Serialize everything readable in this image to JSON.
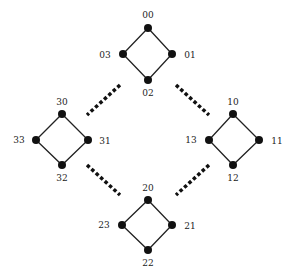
{
  "diagram": {
    "title": "",
    "groups": [
      {
        "name": "0",
        "nodes": [
          {
            "id": "00",
            "x": 148,
            "y": 28,
            "lx": 148,
            "ly": 15
          },
          {
            "id": "01",
            "x": 172,
            "y": 54,
            "lx": 190,
            "ly": 55
          },
          {
            "id": "02",
            "x": 148,
            "y": 80,
            "lx": 148,
            "ly": 93
          },
          {
            "id": "03",
            "x": 123,
            "y": 54,
            "lx": 105,
            "ly": 55
          }
        ]
      },
      {
        "name": "1",
        "nodes": [
          {
            "id": "10",
            "x": 233,
            "y": 114,
            "lx": 233,
            "ly": 102
          },
          {
            "id": "11",
            "x": 259,
            "y": 140,
            "lx": 277,
            "ly": 141
          },
          {
            "id": "12",
            "x": 233,
            "y": 165,
            "lx": 233,
            "ly": 178
          },
          {
            "id": "13",
            "x": 209,
            "y": 140,
            "lx": 191,
            "ly": 140
          }
        ]
      },
      {
        "name": "2",
        "nodes": [
          {
            "id": "20",
            "x": 148,
            "y": 200,
            "lx": 148,
            "ly": 188
          },
          {
            "id": "21",
            "x": 172,
            "y": 225,
            "lx": 190,
            "ly": 226
          },
          {
            "id": "22",
            "x": 148,
            "y": 250,
            "lx": 148,
            "ly": 263
          },
          {
            "id": "23",
            "x": 122,
            "y": 225,
            "lx": 104,
            "ly": 225
          }
        ]
      },
      {
        "name": "3",
        "nodes": [
          {
            "id": "30",
            "x": 62,
            "y": 114,
            "lx": 62,
            "ly": 102
          },
          {
            "id": "31",
            "x": 88,
            "y": 140,
            "lx": 105,
            "ly": 141
          },
          {
            "id": "32",
            "x": 62,
            "y": 165,
            "lx": 62,
            "ly": 178
          },
          {
            "id": "33",
            "x": 36,
            "y": 140,
            "lx": 19,
            "ly": 140
          }
        ]
      }
    ],
    "dotted_links": [
      {
        "from": "0",
        "to": "3",
        "x1": 120,
        "y1": 85,
        "x2": 87,
        "y2": 115
      },
      {
        "from": "0",
        "to": "1",
        "x1": 176,
        "y1": 85,
        "x2": 209,
        "y2": 115
      },
      {
        "from": "3",
        "to": "2",
        "x1": 87,
        "y1": 165,
        "x2": 120,
        "y2": 195
      },
      {
        "from": "1",
        "to": "2",
        "x1": 209,
        "y1": 165,
        "x2": 176,
        "y2": 195
      }
    ],
    "colors": {
      "node": "#111111",
      "edge": "#222222",
      "dots": "#111111",
      "label": "#222222"
    }
  }
}
